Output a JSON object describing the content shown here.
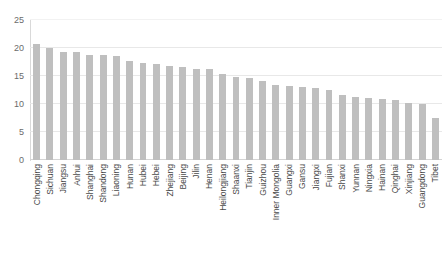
{
  "chart_data": {
    "type": "bar",
    "title": "",
    "subtitle": "",
    "xlabel": "",
    "ylabel": "",
    "ylim": [
      0,
      25
    ],
    "yticks": [
      0,
      5,
      10,
      15,
      20,
      25
    ],
    "ytick_labels": [
      "0",
      "5",
      "10",
      "15",
      "20",
      "25"
    ],
    "grid": true,
    "grid_axis": "y",
    "legend": false,
    "legend_position": "none",
    "bar_color": "#bfbfbf",
    "grid_color": "#e8e8e8",
    "axis_color": "#d9d9d9",
    "text_color": "#595959",
    "categories": [
      "Chongqing",
      "Sichuan",
      "Jiangsu",
      "Anhui",
      "Shanghai",
      "Shandong",
      "Liaoning",
      "Hunan",
      "Hubei",
      "Hebei",
      "Zhejiang",
      "Beijing",
      "Jilin",
      "Henan",
      "Heilongjiang",
      "Shaanxi",
      "Tianjin",
      "Guizhou",
      "Inner Mongolia",
      "Guangxi",
      "Gansu",
      "Jiangxi",
      "Fujian",
      "Shanxi",
      "Yunnan",
      "Ningxia",
      "Hainan",
      "Qinghai",
      "Xinjiang",
      "Guangdong",
      "Tibet"
    ],
    "values": [
      20.7,
      20.0,
      19.3,
      19.3,
      18.8,
      18.8,
      18.6,
      17.6,
      17.4,
      17.2,
      16.8,
      16.6,
      16.3,
      16.2,
      15.4,
      14.8,
      14.7,
      14.1,
      13.4,
      13.2,
      13.0,
      12.8,
      12.5,
      11.6,
      11.2,
      11.0,
      10.9,
      10.7,
      10.1,
      10.0,
      7.5
    ]
  }
}
